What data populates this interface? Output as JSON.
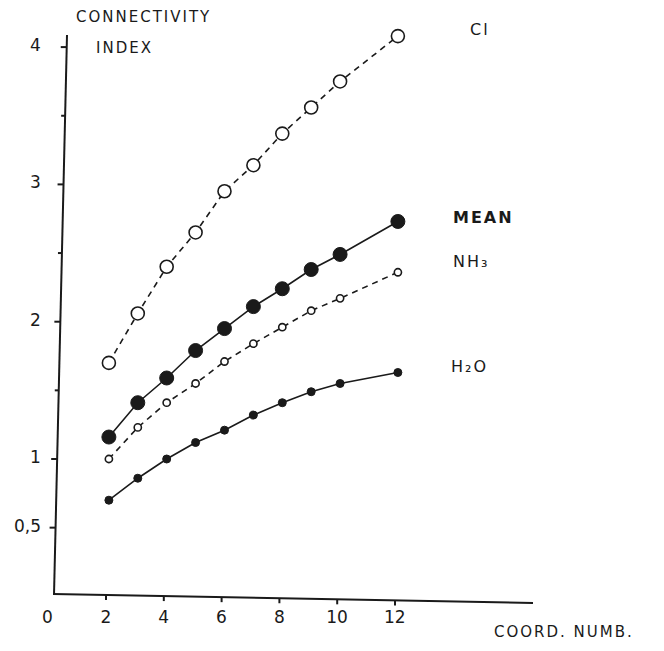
{
  "chart_data": {
    "type": "line",
    "title": "",
    "xlabel": "COORD. NUMB.",
    "ylabel": "CONNECTIVITY INDEX",
    "ylabel_lines": [
      "CONNECTIVITY",
      "INDEX"
    ],
    "xlim": [
      0,
      14
    ],
    "ylim": [
      0,
      4.1
    ],
    "x_ticks": [
      "0",
      "2",
      "4",
      "6",
      "8",
      "10",
      "12"
    ],
    "x_tick_values": [
      0,
      2,
      4,
      6,
      8,
      10,
      12
    ],
    "y_ticks": [
      "0,5",
      "1",
      "2",
      "3",
      "4"
    ],
    "y_tick_values": [
      0.5,
      1,
      2,
      3,
      4
    ],
    "y_minor_ticks": [
      1.5,
      2.5,
      3.5
    ],
    "grid": false,
    "legend_position": "inline-right",
    "x": [
      2,
      3,
      4,
      5,
      6,
      7,
      8,
      9,
      10,
      12
    ],
    "series": [
      {
        "name": "Cl",
        "label": "Cl",
        "marker": "large-open-circle",
        "line": "dashed",
        "values": [
          1.7,
          2.06,
          2.4,
          2.65,
          2.95,
          3.14,
          3.37,
          3.56,
          3.75,
          4.08
        ]
      },
      {
        "name": "MEAN",
        "label": "MEAN",
        "marker": "large-filled-circle",
        "line": "solid",
        "values": [
          1.16,
          1.41,
          1.59,
          1.79,
          1.95,
          2.11,
          2.24,
          2.38,
          2.49,
          2.73
        ]
      },
      {
        "name": "NH3",
        "label": "NH₃",
        "marker": "small-open-circle",
        "line": "dashed",
        "values": [
          1.0,
          1.23,
          1.41,
          1.55,
          1.71,
          1.84,
          1.96,
          2.08,
          2.17,
          2.36
        ]
      },
      {
        "name": "H2O",
        "label": "H₂O",
        "marker": "small-filled-circle",
        "line": "solid",
        "values": [
          0.7,
          0.86,
          1.0,
          1.12,
          1.21,
          1.32,
          1.41,
          1.49,
          1.55,
          1.63
        ]
      }
    ]
  },
  "labels": {
    "ytitle_1": "CONNECTIVITY",
    "ytitle_2": "INDEX",
    "xtitle": "COORD. NUMB.",
    "cl": "Cl",
    "mean": "MEAN",
    "nh3": "NH₃",
    "h2o": "H₂O"
  },
  "colors": {
    "ink": "#1a1a1a",
    "background": "#ffffff"
  }
}
